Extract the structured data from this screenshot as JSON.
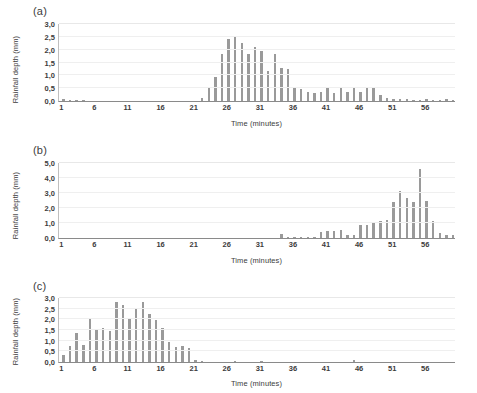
{
  "figure": {
    "background": "#ffffff",
    "bar_color": "#9a9a9a",
    "grid_color": "#efefef",
    "axis_color": "#8a8a8a"
  },
  "panels": [
    {
      "label": "(a)",
      "chart_data": {
        "type": "bar",
        "title": "",
        "xlabel": "Time (minutes)",
        "ylabel": "Rainfall depth (mm)",
        "ylim": [
          0.0,
          3.0
        ],
        "yticks": [
          "0,0",
          "0,5",
          "1,0",
          "1,5",
          "2,0",
          "2,5",
          "3,0"
        ],
        "ytick_values": [
          0.0,
          0.5,
          1.0,
          1.5,
          2.0,
          2.5,
          3.0
        ],
        "xlim": [
          1,
          60
        ],
        "xticks": [
          1,
          6,
          11,
          16,
          21,
          26,
          31,
          36,
          41,
          46,
          51,
          56
        ],
        "grid": true,
        "legend": "none",
        "x": [
          1,
          2,
          3,
          4,
          5,
          6,
          7,
          8,
          9,
          10,
          11,
          12,
          13,
          14,
          15,
          16,
          17,
          18,
          19,
          20,
          21,
          22,
          23,
          24,
          25,
          26,
          27,
          28,
          29,
          30,
          31,
          32,
          33,
          34,
          35,
          36,
          37,
          38,
          39,
          40,
          41,
          42,
          43,
          44,
          45,
          46,
          47,
          48,
          49,
          50,
          51,
          52,
          53,
          54,
          55,
          56,
          57,
          58,
          59,
          60
        ],
        "values": [
          0.06,
          0.04,
          0.04,
          0.03,
          0.0,
          0.0,
          0.0,
          0.0,
          0.0,
          0.0,
          0.0,
          0.0,
          0.0,
          0.0,
          0.0,
          0.0,
          0.0,
          0.0,
          0.0,
          0.0,
          0.0,
          0.1,
          0.55,
          0.95,
          1.85,
          2.4,
          2.55,
          2.25,
          1.85,
          2.1,
          1.95,
          1.15,
          1.85,
          1.3,
          1.25,
          0.55,
          0.45,
          0.35,
          0.3,
          0.35,
          0.55,
          0.3,
          0.5,
          0.35,
          0.5,
          0.35,
          0.5,
          0.5,
          0.25,
          0.1,
          0.08,
          0.08,
          0.08,
          0.05,
          0.05,
          0.06,
          0.05,
          0.04,
          0.06,
          0.05
        ]
      }
    },
    {
      "label": "(b)",
      "chart_data": {
        "type": "bar",
        "title": "",
        "xlabel": "Time (minutes)",
        "ylabel": "Rainfall depth (mm)",
        "ylim": [
          0.0,
          5.0
        ],
        "yticks": [
          "0,0",
          "1,0",
          "2,0",
          "3,0",
          "4,0",
          "5,0"
        ],
        "ytick_values": [
          0.0,
          1.0,
          2.0,
          3.0,
          4.0,
          5.0
        ],
        "xlim": [
          1,
          60
        ],
        "xticks": [
          1,
          6,
          11,
          16,
          21,
          26,
          31,
          36,
          41,
          46,
          51,
          56
        ],
        "grid": true,
        "legend": "none",
        "x": [
          1,
          2,
          3,
          4,
          5,
          6,
          7,
          8,
          9,
          10,
          11,
          12,
          13,
          14,
          15,
          16,
          17,
          18,
          19,
          20,
          21,
          22,
          23,
          24,
          25,
          26,
          27,
          28,
          29,
          30,
          31,
          32,
          33,
          34,
          35,
          36,
          37,
          38,
          39,
          40,
          41,
          42,
          43,
          44,
          45,
          46,
          47,
          48,
          49,
          50,
          51,
          52,
          53,
          54,
          55,
          56,
          57,
          58,
          59,
          60
        ],
        "values": [
          0.0,
          0.0,
          0.0,
          0.0,
          0.0,
          0.0,
          0.0,
          0.0,
          0.0,
          0.0,
          0.0,
          0.0,
          0.0,
          0.0,
          0.0,
          0.0,
          0.0,
          0.0,
          0.0,
          0.0,
          0.0,
          0.0,
          0.0,
          0.0,
          0.0,
          0.0,
          0.0,
          0.0,
          0.0,
          0.0,
          0.0,
          0.0,
          0.0,
          0.25,
          0.1,
          0.1,
          0.1,
          0.1,
          0.1,
          0.4,
          0.5,
          0.45,
          0.55,
          0.2,
          0.2,
          0.9,
          0.85,
          1.1,
          1.15,
          1.2,
          2.4,
          3.15,
          2.7,
          2.4,
          4.6,
          2.5,
          1.15,
          0.35,
          0.2,
          0.2
        ]
      }
    },
    {
      "label": "(c)",
      "chart_data": {
        "type": "bar",
        "title": "",
        "xlabel": "Time (minutes)",
        "ylabel": "Rainfall depth (mm)",
        "ylim": [
          0.0,
          3.0
        ],
        "yticks": [
          "0,0",
          "0,5",
          "1,0",
          "1,5",
          "2,0",
          "2,5",
          "3,0"
        ],
        "ytick_values": [
          0.0,
          0.5,
          1.0,
          1.5,
          2.0,
          2.5,
          3.0
        ],
        "xlim": [
          1,
          60
        ],
        "xticks": [
          1,
          6,
          11,
          16,
          21,
          26,
          31,
          36,
          41,
          46,
          51,
          56
        ],
        "grid": true,
        "legend": "none",
        "x": [
          1,
          2,
          3,
          4,
          5,
          6,
          7,
          8,
          9,
          10,
          11,
          12,
          13,
          14,
          15,
          16,
          17,
          18,
          19,
          20,
          21,
          22,
          23,
          24,
          25,
          26,
          27,
          28,
          29,
          30,
          31,
          32,
          33,
          34,
          35,
          36,
          37,
          38,
          39,
          40,
          41,
          42,
          43,
          44,
          45,
          46,
          47,
          48,
          49,
          50,
          51,
          52,
          53,
          54,
          55,
          56,
          57,
          58,
          59,
          60
        ],
        "values": [
          0.35,
          0.75,
          1.35,
          0.8,
          2.0,
          1.5,
          1.6,
          1.45,
          2.8,
          2.65,
          2.05,
          2.5,
          2.8,
          2.25,
          1.95,
          1.6,
          0.95,
          0.7,
          0.75,
          0.65,
          0.1,
          0.05,
          0.0,
          0.0,
          0.0,
          0.0,
          0.05,
          0.0,
          0.0,
          0.0,
          0.05,
          0.0,
          0.0,
          0.0,
          0.0,
          0.0,
          0.0,
          0.0,
          0.0,
          0.0,
          0.0,
          0.0,
          0.0,
          0.0,
          0.08,
          0.0,
          0.0,
          0.0,
          0.0,
          0.0,
          0.0,
          0.0,
          0.0,
          0.0,
          0.0,
          0.0,
          0.0,
          0.0,
          0.0,
          0.0
        ]
      }
    }
  ]
}
